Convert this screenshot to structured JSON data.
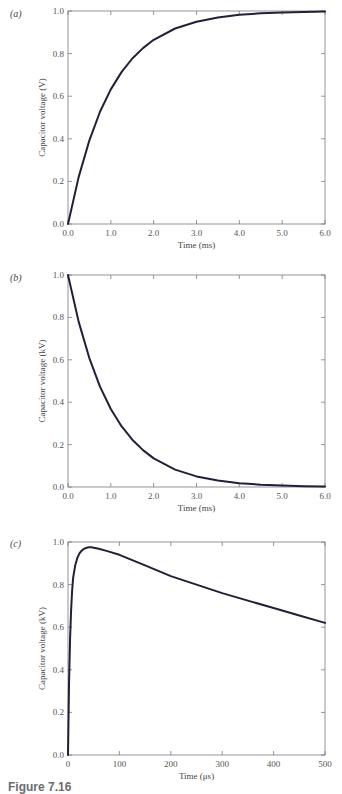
{
  "chart_data": [
    {
      "id": "a",
      "panel_label": "(a)",
      "type": "line",
      "title": "",
      "xlabel": "Time (ms)",
      "ylabel": "Capacitor voltage (V)",
      "xlim": [
        0,
        6.0
      ],
      "ylim": [
        0,
        1.0
      ],
      "xticks": [
        "0.0",
        "1.0",
        "2.0",
        "3.0",
        "4.0",
        "5.0",
        "6.0"
      ],
      "yticks": [
        "0.0",
        "0.2",
        "0.4",
        "0.6",
        "0.8",
        "1.0"
      ],
      "grid": false,
      "legend": null,
      "series": [
        {
          "name": "capacitor voltage",
          "x": [
            0,
            0.25,
            0.5,
            0.75,
            1.0,
            1.25,
            1.5,
            1.75,
            2.0,
            2.5,
            3.0,
            3.5,
            4.0,
            4.5,
            5.0,
            5.5,
            6.0
          ],
          "y": [
            0,
            0.221,
            0.393,
            0.528,
            0.632,
            0.713,
            0.777,
            0.826,
            0.865,
            0.918,
            0.95,
            0.97,
            0.982,
            0.989,
            0.993,
            0.996,
            0.998
          ]
        }
      ]
    },
    {
      "id": "b",
      "panel_label": "(b)",
      "type": "line",
      "title": "",
      "xlabel": "Time (ms)",
      "ylabel": "Capacitor voltage (kV)",
      "xlim": [
        0,
        6.0
      ],
      "ylim": [
        0,
        1.0
      ],
      "xticks": [
        "0.0",
        "1.0",
        "2.0",
        "3.0",
        "4.0",
        "5.0",
        "6.0"
      ],
      "yticks": [
        "0.0",
        "0.2",
        "0.4",
        "0.6",
        "0.8",
        "1.0"
      ],
      "grid": false,
      "legend": null,
      "series": [
        {
          "name": "capacitor voltage",
          "x": [
            0,
            0.25,
            0.5,
            0.75,
            1.0,
            1.25,
            1.5,
            1.75,
            2.0,
            2.5,
            3.0,
            3.5,
            4.0,
            4.5,
            5.0,
            5.5,
            6.0
          ],
          "y": [
            1.0,
            0.779,
            0.607,
            0.472,
            0.368,
            0.287,
            0.223,
            0.174,
            0.135,
            0.082,
            0.05,
            0.03,
            0.018,
            0.011,
            0.007,
            0.004,
            0.002
          ]
        }
      ]
    },
    {
      "id": "c",
      "panel_label": "(c)",
      "type": "line",
      "title": "",
      "xlabel": "Time (μs)",
      "ylabel": "Capacitor voltage (kV)",
      "xlim": [
        0,
        500
      ],
      "ylim": [
        0,
        1.0
      ],
      "xticks": [
        "0",
        "100",
        "200",
        "300",
        "400",
        "500"
      ],
      "yticks": [
        "0.0",
        "0.2",
        "0.4",
        "0.6",
        "0.8",
        "1.0"
      ],
      "grid": false,
      "legend": null,
      "series": [
        {
          "name": "capacitor voltage",
          "x": [
            0,
            2,
            4,
            6,
            8,
            10,
            14,
            18,
            22,
            26,
            30,
            35,
            40,
            45,
            50,
            60,
            75,
            100,
            150,
            200,
            250,
            300,
            350,
            400,
            450,
            500
          ],
          "y": [
            0,
            0.33,
            0.55,
            0.68,
            0.77,
            0.83,
            0.89,
            0.925,
            0.945,
            0.958,
            0.966,
            0.972,
            0.975,
            0.975,
            0.973,
            0.968,
            0.958,
            0.94,
            0.89,
            0.84,
            0.8,
            0.76,
            0.725,
            0.69,
            0.655,
            0.62
          ]
        }
      ]
    }
  ],
  "caption": "Figure 7.16"
}
